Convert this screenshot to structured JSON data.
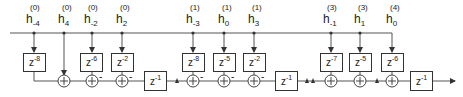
{
  "diagram": {
    "colors": {
      "line": "#333333",
      "text": "#222222",
      "background": "#ffffff"
    },
    "coefficients": [
      {
        "id": "c1",
        "base": "h",
        "sub": "-4",
        "sup": "(0)",
        "x": 34,
        "delay": {
          "label": "z",
          "exp": "-8"
        }
      },
      {
        "id": "c2",
        "base": "h",
        "sub": "4",
        "sup": "(0)",
        "x": 64,
        "delay": null
      },
      {
        "id": "c3",
        "base": "h",
        "sub": "-2",
        "sup": "(0)",
        "x": 92,
        "delay": {
          "label": "z",
          "exp": "-6"
        },
        "adder_sign": "-"
      },
      {
        "id": "c4",
        "base": "h",
        "sub": "2",
        "sup": "(0)",
        "x": 122,
        "delay": {
          "label": "z",
          "exp": "-2"
        },
        "adder_sign": "-"
      },
      {
        "id": "c5",
        "base": "h",
        "sub": "-3",
        "sup": "(1)",
        "x": 193,
        "delay": {
          "label": "z",
          "exp": "-8"
        },
        "adder_sign": "-"
      },
      {
        "id": "c6",
        "base": "h",
        "sub": "0",
        "sup": "(1)",
        "x": 224,
        "delay": {
          "label": "z",
          "exp": "-5"
        },
        "adder_sign": "-"
      },
      {
        "id": "c7",
        "base": "h",
        "sub": "3",
        "sup": "(1)",
        "x": 254,
        "delay": {
          "label": "z",
          "exp": "-2"
        },
        "adder_sign": "-"
      },
      {
        "id": "c8",
        "base": "h",
        "sub": "-1",
        "sup": "(3)",
        "x": 331,
        "delay": {
          "label": "z",
          "exp": "-7"
        }
      },
      {
        "id": "c9",
        "base": "h",
        "sub": "1",
        "sup": "(3)",
        "x": 360,
        "delay": {
          "label": "z",
          "exp": "-5"
        }
      },
      {
        "id": "c10",
        "base": "h",
        "sub": "0",
        "sup": "(4)",
        "x": 392,
        "delay": {
          "label": "z",
          "exp": "-6"
        }
      }
    ],
    "unit_delays": [
      {
        "id": "d1",
        "label": "z",
        "exp": "-1",
        "x": 144
      },
      {
        "id": "d2",
        "label": "z",
        "exp": "-1",
        "x": 275
      },
      {
        "id": "d3",
        "label": "z",
        "exp": "-1",
        "x": 410
      }
    ],
    "labels": {
      "c1": {
        "h": "h",
        "sub": "-4",
        "sup": "(0)"
      },
      "c2": {
        "h": "h",
        "sub": "4",
        "sup": "(0)"
      },
      "c3": {
        "h": "h",
        "sub": "-2",
        "sup": "(0)"
      },
      "c4": {
        "h": "h",
        "sub": "2",
        "sup": "(0)"
      },
      "c5": {
        "h": "h",
        "sub": "-3",
        "sup": "(1)"
      },
      "c6": {
        "h": "h",
        "sub": "0",
        "sup": "(1)"
      },
      "c7": {
        "h": "h",
        "sub": "3",
        "sup": "(1)"
      },
      "c8": {
        "h": "h",
        "sub": "-1",
        "sup": "(3)"
      },
      "c9": {
        "h": "h",
        "sub": "1",
        "sup": "(3)"
      },
      "c10": {
        "h": "h",
        "sub": "0",
        "sup": "(4)"
      }
    },
    "boxes": {
      "b1": {
        "z": "z",
        "exp": "-8"
      },
      "b3": {
        "z": "z",
        "exp": "-6"
      },
      "b4": {
        "z": "z",
        "exp": "-2"
      },
      "b5": {
        "z": "z",
        "exp": "-8"
      },
      "b6": {
        "z": "z",
        "exp": "-5"
      },
      "b7": {
        "z": "z",
        "exp": "-2"
      },
      "b8": {
        "z": "z",
        "exp": "-7"
      },
      "b9": {
        "z": "z",
        "exp": "-5"
      },
      "b10": {
        "z": "z",
        "exp": "-6"
      },
      "d1": {
        "z": "z",
        "exp": "-1"
      },
      "d2": {
        "z": "z",
        "exp": "-1"
      },
      "d3": {
        "z": "z",
        "exp": "-1"
      }
    },
    "signs": {
      "minus": "-"
    }
  }
}
